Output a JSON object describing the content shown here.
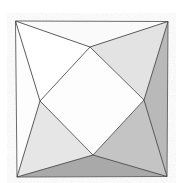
{
  "figure": {
    "kind": "geometric-line-drawing",
    "canvas": {
      "width": 185,
      "height": 183
    },
    "background_color": "#ffffff",
    "stroke_color": "#4a4a4a",
    "stroke_width": 0.9,
    "square": {
      "name": "outer-square",
      "corners": {
        "top_left": {
          "x": 15.5,
          "y": 21.0
        },
        "top_right": {
          "x": 168.0,
          "y": 21.5
        },
        "bottom_right": {
          "x": 167.0,
          "y": 176.5
        },
        "bottom_left": {
          "x": 17.0,
          "y": 177.0
        }
      },
      "fill_color": "#ffffff",
      "stroke_color": "#6b6b6b"
    },
    "inner_quad": {
      "name": "inner-diamond",
      "vertices": {
        "top": {
          "x": 90.0,
          "y": 47.0
        },
        "right": {
          "x": 144.0,
          "y": 100.0
        },
        "bottom": {
          "x": 93.0,
          "y": 155.0
        },
        "left": {
          "x": 40.0,
          "y": 101.0
        }
      },
      "fill_color": "#fdfdfd",
      "stroke_color": "#5a5a5a"
    },
    "facets": [
      {
        "name": "facet-top-left",
        "label": "top-left triangle",
        "points": "15.5,21.0 90.0,47.0 40.0,101.0",
        "fill_color": "#ffffff",
        "tone": "white"
      },
      {
        "name": "facet-top-right",
        "label": "top-right triangle",
        "points": "90.0,47.0 168.0,21.5 144.0,100.0",
        "fill_color": "#e3e3e3",
        "tone": "light-gray"
      },
      {
        "name": "facet-top-wedge",
        "label": "upper thin wedge",
        "points": "15.5,21.0 168.0,21.5 90.0,47.0",
        "fill_color": "#fafafa",
        "tone": "near-white"
      },
      {
        "name": "facet-right",
        "label": "right triangle",
        "points": "168.0,21.5 167.0,176.5 144.0,100.0",
        "fill_color": "#b9b9b9",
        "tone": "medium-gray"
      },
      {
        "name": "facet-left",
        "label": "left thin wedge",
        "points": "15.5,21.0 40.0,101.0 17.0,177.0",
        "fill_color": "#fdfdfd",
        "tone": "near-white"
      },
      {
        "name": "facet-bottom-left",
        "label": "bottom-left triangle",
        "points": "40.0,101.0 93.0,155.0 17.0,177.0",
        "fill_color": "#e6e6e6",
        "tone": "light-gray"
      },
      {
        "name": "facet-bottom-right",
        "label": "bottom-right triangle",
        "points": "144.0,100.0 167.0,176.5 93.0,155.0",
        "fill_color": "#c4c4c4",
        "tone": "medium-gray"
      },
      {
        "name": "facet-bottom-wedge",
        "label": "lower thin wedge",
        "points": "17.0,177.0 93.0,155.0 167.0,176.5",
        "fill_color": "#a9a9a9",
        "tone": "dark-gray"
      }
    ],
    "edges": [
      {
        "name": "edge-square-top",
        "from": "15.5,21.0",
        "to": "168.0,21.5"
      },
      {
        "name": "edge-square-right",
        "from": "168.0,21.5",
        "to": "167.0,176.5"
      },
      {
        "name": "edge-square-bottom",
        "from": "167.0,176.5",
        "to": "17.0,177.0"
      },
      {
        "name": "edge-square-left",
        "from": "17.0,177.0",
        "to": "15.5,21.0"
      },
      {
        "name": "edge-diamond-top-right",
        "from": "90.0,47.0",
        "to": "144.0,100.0"
      },
      {
        "name": "edge-diamond-right-bottom",
        "from": "144.0,100.0",
        "to": "93.0,155.0"
      },
      {
        "name": "edge-diamond-bottom-left",
        "from": "93.0,155.0",
        "to": "40.0,101.0"
      },
      {
        "name": "edge-diamond-left-top",
        "from": "40.0,101.0",
        "to": "90.0,47.0"
      },
      {
        "name": "edge-spoke-tl-top",
        "from": "15.5,21.0",
        "to": "90.0,47.0"
      },
      {
        "name": "edge-spoke-tl-left",
        "from": "15.5,21.0",
        "to": "40.0,101.0"
      },
      {
        "name": "edge-spoke-tr-top",
        "from": "168.0,21.5",
        "to": "90.0,47.0"
      },
      {
        "name": "edge-spoke-tr-right",
        "from": "168.0,21.5",
        "to": "144.0,100.0"
      },
      {
        "name": "edge-spoke-bl-left",
        "from": "17.0,177.0",
        "to": "40.0,101.0"
      },
      {
        "name": "edge-spoke-bl-bottom",
        "from": "17.0,177.0",
        "to": "93.0,155.0"
      },
      {
        "name": "edge-spoke-br-right",
        "from": "167.0,176.5",
        "to": "144.0,100.0"
      },
      {
        "name": "edge-spoke-br-bottom",
        "from": "167.0,176.5",
        "to": "93.0,155.0"
      }
    ]
  }
}
